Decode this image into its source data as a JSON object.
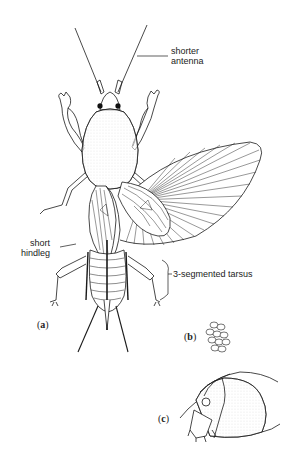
{
  "figure": {
    "panels": [
      {
        "id": "a",
        "label": "(a)",
        "description": "adult mole cricket, dorsal view"
      },
      {
        "id": "b",
        "label": "(b)",
        "description": "egg cluster"
      },
      {
        "id": "c",
        "label": "(c)",
        "description": "side view of head and pronotum"
      }
    ],
    "annotations": {
      "antenna_line1": "shorter",
      "antenna_line2": "antenna",
      "hindleg_line1": "short",
      "hindleg_line2": "hindleg",
      "tarsus": "3-segmented tarsus"
    },
    "panel_labels": {
      "a_open": "(",
      "a": "a",
      "a_close": ")",
      "b_open": "(",
      "b": "b",
      "b_close": ")",
      "c_open": "(",
      "c": "c",
      "c_close": ")"
    },
    "colors": {
      "ink": "#1a1a1a",
      "background": "#ffffff"
    }
  }
}
